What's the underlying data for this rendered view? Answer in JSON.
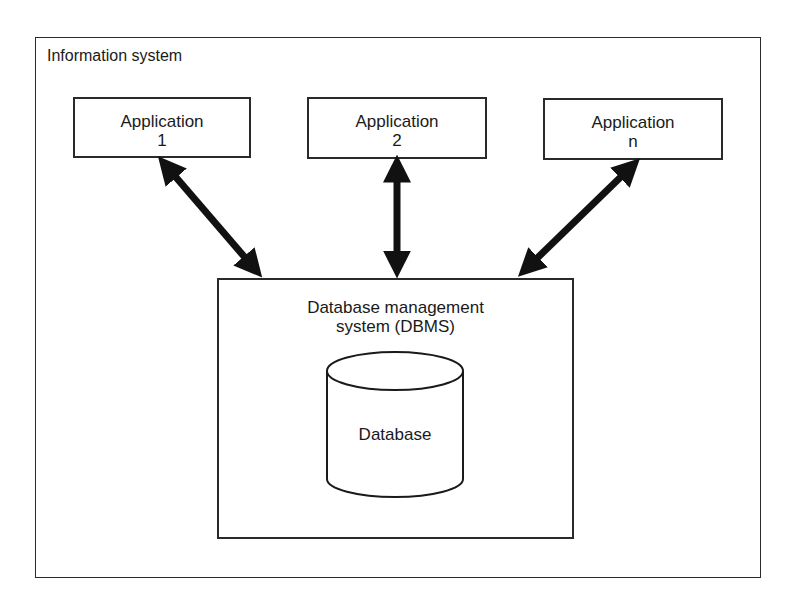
{
  "diagram": {
    "container": {
      "label": "Information system"
    },
    "applications": [
      {
        "line1": "Application",
        "line2": "1"
      },
      {
        "line1": "Application",
        "line2": "2"
      },
      {
        "line1": "Application",
        "line2": "n"
      }
    ],
    "dbms": {
      "line1": "Database management",
      "line2": "system (DBMS)"
    },
    "database": {
      "label": "Database"
    },
    "connections": [
      {
        "from": "Application 1",
        "to": "DBMS",
        "type": "bidirectional"
      },
      {
        "from": "Application 2",
        "to": "DBMS",
        "type": "bidirectional"
      },
      {
        "from": "Application n",
        "to": "DBMS",
        "type": "bidirectional"
      }
    ],
    "colors": {
      "stroke": "#1a1a1a",
      "background": "#ffffff"
    }
  }
}
